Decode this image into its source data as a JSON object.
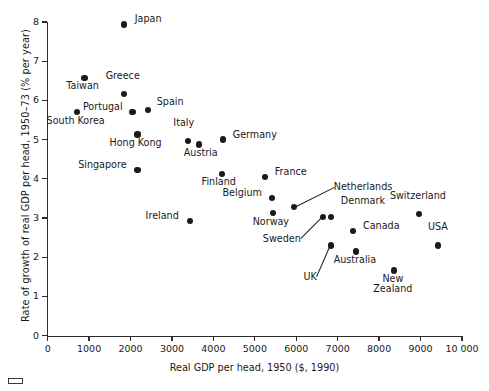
{
  "chart_data": {
    "type": "scatter",
    "title": "",
    "xlabel": "Real GDP per head, 1950 ($, 1990)",
    "ylabel": "Rate of growth of real GDP per head, 1950–73 (% per year)",
    "xlim": [
      0,
      10000
    ],
    "ylim": [
      0,
      8
    ],
    "grid": false,
    "legend": "none",
    "xticks": [
      0,
      1000,
      2000,
      3000,
      4000,
      5000,
      6000,
      7000,
      8000,
      9000,
      10000
    ],
    "xtick_labels": [
      "0",
      "1000",
      "2000",
      "3000",
      "4000",
      "5000",
      "6000",
      "7000",
      "8000",
      "9000",
      "10 000"
    ],
    "yticks": [
      0,
      1,
      2,
      3,
      4,
      5,
      6,
      7,
      8
    ],
    "ytick_labels": [
      "0",
      "1",
      "2",
      "3",
      "4",
      "5",
      "6",
      "7",
      "8"
    ],
    "points": [
      {
        "label": "Japan",
        "x": 1835,
        "y": 7.94,
        "lx": 11,
        "ly": -5,
        "align": "left",
        "leader": false
      },
      {
        "label": "Taiwan",
        "x": 890,
        "y": 6.57,
        "lx": -2,
        "ly": 8,
        "align": "center",
        "leader": false
      },
      {
        "label": "Greece",
        "x": 1835,
        "y": 6.16,
        "lx": -1,
        "ly": -18,
        "align": "center",
        "leader": false
      },
      {
        "label": "Portugal",
        "x": 2050,
        "y": 5.7,
        "lx": -10,
        "ly": -5,
        "align": "right",
        "leader": false
      },
      {
        "label": "Spain",
        "x": 2415,
        "y": 5.75,
        "lx": 9,
        "ly": -8,
        "align": "left",
        "leader": false
      },
      {
        "label": "South Korea",
        "x": 700,
        "y": 5.7,
        "lx": -1,
        "ly": 9,
        "align": "center",
        "leader": false
      },
      {
        "label": "Hong Kong",
        "x": 2170,
        "y": 5.13,
        "lx": -2,
        "ly": 8,
        "align": "center",
        "leader": false
      },
      {
        "label": "Singapore",
        "x": 2170,
        "y": 4.23,
        "lx": -11,
        "ly": -5,
        "align": "right",
        "leader": false
      },
      {
        "label": "Italy",
        "x": 3380,
        "y": 4.96,
        "lx": -4,
        "ly": -18,
        "align": "center",
        "leader": false
      },
      {
        "label": "Austria",
        "x": 3645,
        "y": 4.88,
        "lx": 2,
        "ly": 9,
        "align": "center",
        "leader": false
      },
      {
        "label": "Germany",
        "x": 4225,
        "y": 5.0,
        "lx": 10,
        "ly": -5,
        "align": "left",
        "leader": false
      },
      {
        "label": "Finland",
        "x": 4200,
        "y": 4.13,
        "lx": -3,
        "ly": 8,
        "align": "center",
        "leader": false
      },
      {
        "label": "France",
        "x": 5240,
        "y": 4.05,
        "lx": 10,
        "ly": -5,
        "align": "left",
        "leader": false
      },
      {
        "label": "Belgium",
        "x": 5410,
        "y": 3.51,
        "lx": -10,
        "ly": -5,
        "align": "right",
        "leader": false
      },
      {
        "label": "Norway",
        "x": 5435,
        "y": 3.13,
        "lx": -2,
        "ly": 9,
        "align": "center",
        "leader": false
      },
      {
        "label": "Netherlands",
        "x": 5940,
        "y": 3.28,
        "lx": 40,
        "ly": -20,
        "align": "left",
        "leader": true
      },
      {
        "label": "Ireland",
        "x": 3430,
        "y": 2.92,
        "lx": -11,
        "ly": -5,
        "align": "right",
        "leader": false
      },
      {
        "label": "Sweden",
        "x": 6640,
        "y": 3.03,
        "lx": -22,
        "ly": 22,
        "align": "right",
        "leader": true
      },
      {
        "label": "Denmark",
        "x": 6835,
        "y": 3.03,
        "lx": 10,
        "ly": -16,
        "align": "left",
        "leader": false
      },
      {
        "label": "Canada",
        "x": 7370,
        "y": 2.67,
        "lx": 10,
        "ly": -5,
        "align": "left",
        "leader": false
      },
      {
        "label": "UK",
        "x": 6835,
        "y": 2.3,
        "lx": -14,
        "ly": 32,
        "align": "right",
        "leader": true
      },
      {
        "label": "Australia",
        "x": 7440,
        "y": 2.15,
        "lx": -1,
        "ly": 9,
        "align": "center",
        "leader": false
      },
      {
        "label": "Switzerland",
        "x": 8960,
        "y": 3.1,
        "lx": -1,
        "ly": -18,
        "align": "center",
        "leader": false
      },
      {
        "label": "USA",
        "x": 9420,
        "y": 2.3,
        "lx": 0,
        "ly": -18,
        "align": "center",
        "leader": false
      },
      {
        "label": "New Zealand",
        "x": 8355,
        "y": 1.66,
        "lx": -1,
        "ly": 8,
        "align": "center",
        "leader": false,
        "multiline": [
          "New",
          "Zealand"
        ]
      }
    ]
  },
  "colors": {
    "point": "#1a1a1a",
    "axis": "#2b2b2b",
    "background": "#ffffff",
    "text": "#1a1a1a"
  }
}
